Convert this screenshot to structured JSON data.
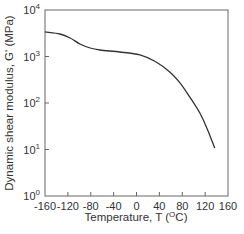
{
  "chart_data": {
    "type": "line",
    "title": "",
    "xlabel": "Temperature,  T  (°C)",
    "xlabel_parts": {
      "main": "Temperature,  T  (",
      "sup": "O",
      "tail": "C)"
    },
    "ylabel": "Dynamic shear modulus, G' (MPa)",
    "xlim": [
      -160,
      160
    ],
    "ylim": [
      1,
      10000
    ],
    "yscale": "log",
    "grid": false,
    "legend": null,
    "x_ticks": [
      -160,
      -120,
      -80,
      -40,
      0,
      40,
      80,
      120,
      160
    ],
    "x_tick_labels": [
      "-160",
      "-120",
      "-80",
      "-40",
      "0",
      "40",
      "80",
      "120",
      "160"
    ],
    "y_ticks": [
      1,
      10,
      100,
      1000,
      10000
    ],
    "y_tick_labels": [
      {
        "base": "10",
        "exp": "0"
      },
      {
        "base": "10",
        "exp": "1"
      },
      {
        "base": "10",
        "exp": "2"
      },
      {
        "base": "10",
        "exp": "3"
      },
      {
        "base": "10",
        "exp": "4"
      }
    ],
    "series": [
      {
        "name": "G'",
        "color": "#333333",
        "x": [
          -160,
          -134,
          -116,
          -99,
          -81,
          -64,
          -29,
          6,
          32,
          58,
          76,
          93,
          111,
          123,
          137
        ],
        "y": [
          3380,
          3050,
          2500,
          1860,
          1520,
          1380,
          1250,
          1080,
          790,
          465,
          270,
          135,
          60,
          29,
          10.7
        ]
      }
    ]
  }
}
